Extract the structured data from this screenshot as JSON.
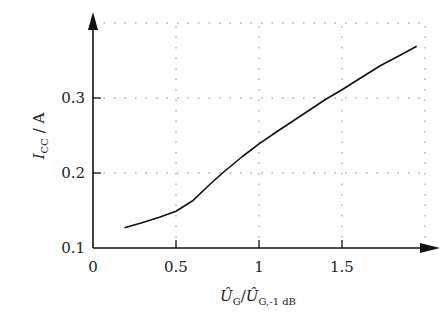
{
  "chart_data": {
    "type": "line",
    "title": "",
    "xlabel": "Û_G / Û_G,-1 dB",
    "ylabel": "I_CC / A",
    "xlim": [
      0,
      2.0
    ],
    "ylim": [
      0.1,
      0.4
    ],
    "grid": true,
    "grid_style": "dotted",
    "legend": null,
    "x_ticks": [
      0,
      0.5,
      1,
      1.5
    ],
    "x_tick_labels": [
      "0",
      "0.5",
      "1",
      "1.5"
    ],
    "y_ticks": [
      0.1,
      0.2,
      0.3
    ],
    "y_tick_labels": [
      "0.1",
      "0.2",
      "0.3"
    ],
    "series": [
      {
        "name": "I_CC",
        "color": "#111111",
        "x": [
          0.19,
          0.3,
          0.4,
          0.5,
          0.6,
          0.7,
          0.78,
          0.9,
          1.0,
          1.1,
          1.25,
          1.4,
          1.5,
          1.6,
          1.73,
          1.85,
          1.95
        ],
        "y": [
          0.127,
          0.134,
          0.141,
          0.149,
          0.163,
          0.184,
          0.2,
          0.222,
          0.239,
          0.254,
          0.276,
          0.298,
          0.311,
          0.325,
          0.343,
          0.357,
          0.369
        ]
      }
    ]
  },
  "labels": {
    "x_main": "Û",
    "x_sub1": "G",
    "x_slash": "/",
    "x_main2": "Û",
    "x_sub2": "G,-1 dB",
    "y_main": "I",
    "y_sub": "CC",
    "y_unit": " / A"
  }
}
